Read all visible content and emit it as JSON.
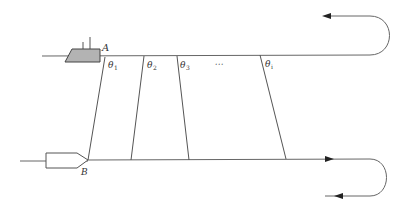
{
  "diagram": {
    "points": {
      "A": "A",
      "B": "B"
    },
    "angles": [
      {
        "symbol": "θ",
        "subscript": "1"
      },
      {
        "symbol": "θ",
        "subscript": "2"
      },
      {
        "symbol": "θ",
        "subscript": "3"
      },
      {
        "symbol": "θ",
        "subscript": "i"
      }
    ],
    "ellipsis": "⋯",
    "colors": {
      "line": "#555555",
      "ship_fill": "#b3b3b3",
      "text": "#333333"
    }
  }
}
